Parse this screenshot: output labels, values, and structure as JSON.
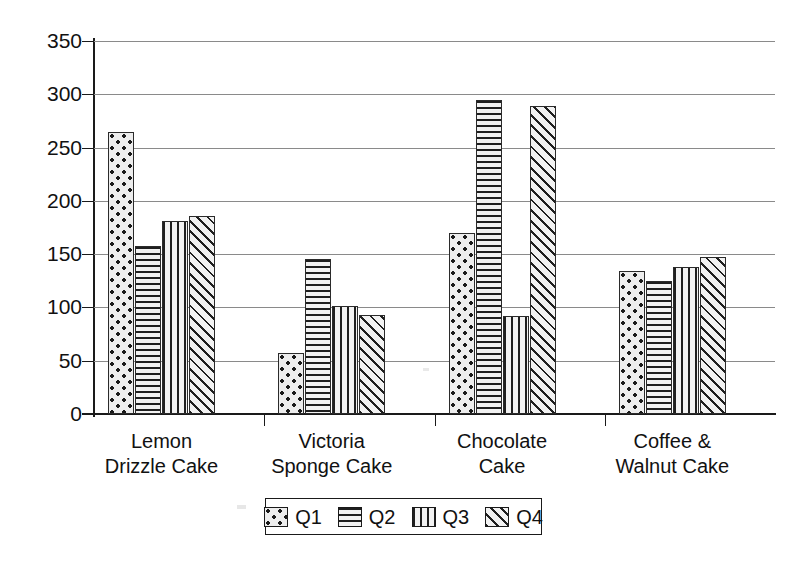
{
  "chart_data": {
    "type": "bar",
    "title": "",
    "subtitle": "",
    "xlabel": "",
    "ylabel": "",
    "ylim": [
      0,
      350
    ],
    "ytick_step": 50,
    "ytick_labels": [
      "350",
      "300",
      "250",
      "200",
      "150",
      "100",
      "50",
      "0"
    ],
    "ytick_values": [
      350,
      300,
      250,
      200,
      150,
      100,
      50,
      0
    ],
    "grid": true,
    "legend_position": "bottom-center",
    "categories": [
      "Lemon Drizzle Cake",
      "Victoria Sponge Cake",
      "Chocolate Cake",
      "Coffee & Walnut Cake"
    ],
    "category_lines": [
      [
        "Lemon",
        "Drizzle Cake"
      ],
      [
        "Victoria",
        "Sponge Cake"
      ],
      [
        "Chocolate",
        "Cake"
      ],
      [
        "Coffee &",
        "Walnut Cake"
      ]
    ],
    "series": [
      {
        "name": "Q1",
        "pattern": "dots",
        "values": [
          265,
          57,
          170,
          134
        ]
      },
      {
        "name": "Q2",
        "pattern": "hlines",
        "values": [
          158,
          145,
          295,
          125
        ]
      },
      {
        "name": "Q3",
        "pattern": "vlines",
        "values": [
          181,
          101,
          92,
          138
        ]
      },
      {
        "name": "Q4",
        "pattern": "diag",
        "values": [
          186,
          93,
          289,
          147
        ]
      }
    ]
  },
  "legend": {
    "entries": [
      {
        "label": "Q1",
        "pattern": "dots"
      },
      {
        "label": "Q2",
        "pattern": "hlines"
      },
      {
        "label": "Q3",
        "pattern": "vlines"
      },
      {
        "label": "Q4",
        "pattern": "diag"
      }
    ]
  },
  "colors": {
    "axis": "#1a1a1a",
    "gridline": "#8a8a8a",
    "bar_fill": "#ededed",
    "bar_pattern": "#1f1f1f",
    "background": "#ffffff",
    "text": "#111111"
  }
}
